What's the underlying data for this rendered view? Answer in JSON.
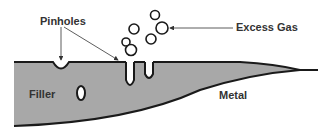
{
  "diagram": {
    "labels": {
      "pinholes": "Pinholes",
      "excess_gas": "Excess Gas",
      "filler": "Filler",
      "metal": "Metal"
    },
    "colors": {
      "filler_fill": "#a8a8a8",
      "outline": "#1a1a1a",
      "text": "#333333"
    }
  }
}
